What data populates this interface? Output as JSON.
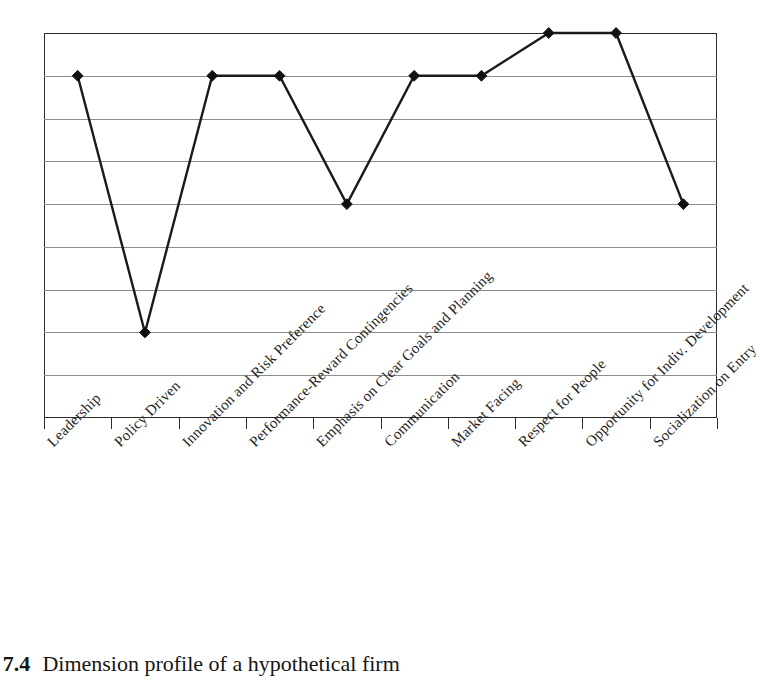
{
  "figure": {
    "caption_number": "ure 7.4",
    "caption_text": "Dimension profile of a hypothetical firm"
  },
  "axis": {
    "tick_count": 11,
    "gridline_count": 8
  },
  "colors": {
    "line": "#1a1a1a",
    "marker": "#111111",
    "grid": "#8d8d8d",
    "frame": "#2b2b2b",
    "background": "#ffffff"
  },
  "chart_data": {
    "type": "line",
    "title": "Dimension profile of a hypothetical firm",
    "xlabel": "",
    "ylabel": "",
    "ylim": [
      0,
      9
    ],
    "grid": true,
    "legend": "none",
    "marker": "diamond",
    "categories": [
      "Leadership",
      "Policy Driven",
      "Innovation and Risk Preference",
      "Performance-Reward Contingencies",
      "Emphasis on Clear Goals and Planning",
      "Communication",
      "Market Facing",
      "Respect for People",
      "Opportunity for Indiv. Development",
      "Socialization on Entry"
    ],
    "values": [
      8,
      2,
      8,
      8,
      5,
      8,
      8,
      9,
      9,
      5
    ],
    "tick_labels": [],
    "y_gridline_values": [
      9,
      8,
      7,
      6,
      5,
      4,
      3,
      2,
      1,
      0
    ]
  }
}
